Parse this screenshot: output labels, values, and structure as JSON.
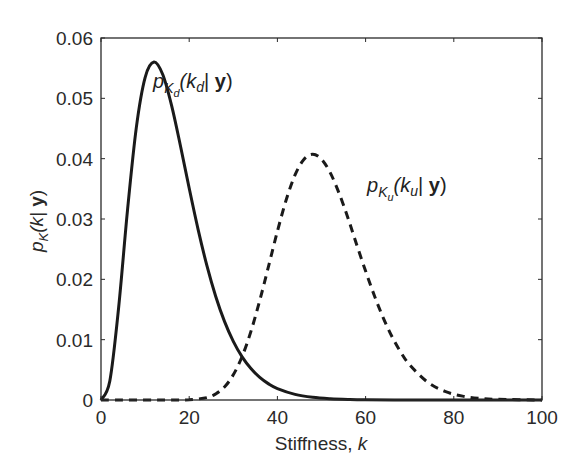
{
  "chart_data": {
    "type": "line",
    "title": "",
    "xlabel": "Stiffness, k",
    "ylabel": "p_K(k| y)",
    "xlim": [
      0,
      100
    ],
    "ylim": [
      0,
      0.06
    ],
    "grid": false,
    "legend": null,
    "x_ticks": [
      0,
      20,
      40,
      60,
      80,
      100
    ],
    "x_tick_labels": [
      "0",
      "20",
      "40",
      "60",
      "80",
      "100"
    ],
    "y_ticks": [
      0,
      0.01,
      0.02,
      0.03,
      0.04,
      0.05,
      0.06
    ],
    "y_tick_labels": [
      "0",
      "0.01",
      "0.02",
      "0.03",
      "0.04",
      "0.05",
      "0.06"
    ],
    "series": [
      {
        "name": "p_Kd(k_d| y)",
        "style": "solid",
        "color": "#1a1a1a",
        "x": [
          0,
          2,
          4,
          6,
          8,
          10,
          12,
          14,
          16,
          18,
          20,
          22,
          24,
          26,
          28,
          30,
          32,
          34,
          36,
          38,
          40,
          44,
          48,
          52,
          56,
          60,
          70,
          80,
          90,
          100
        ],
        "values": [
          0,
          0.00316,
          0.01533,
          0.03138,
          0.04511,
          0.05344,
          0.05601,
          0.05395,
          0.04884,
          0.04219,
          0.03509,
          0.02833,
          0.02231,
          0.0172,
          0.01303,
          0.00972,
          0.00715,
          0.00521,
          0.00375,
          0.00267,
          0.00189,
          0.00093,
          0.00044,
          0.00021,
          9.5e-05,
          4e-05,
          6e-06,
          0,
          0,
          0
        ]
      },
      {
        "name": "p_Ku(k_u| y)",
        "style": "dashed",
        "color": "#1a1a1a",
        "x": [
          0,
          16,
          20,
          24,
          26,
          28,
          30,
          32,
          34,
          36,
          38,
          40,
          42,
          44,
          46,
          48,
          50,
          52,
          54,
          56,
          58,
          60,
          62,
          64,
          66,
          68,
          70,
          74,
          78,
          82,
          86,
          90,
          100
        ],
        "values": [
          0,
          0,
          3.7e-05,
          0.00039,
          0.001,
          0.00215,
          0.00417,
          0.00721,
          0.01137,
          0.01649,
          0.02219,
          0.02796,
          0.03318,
          0.0373,
          0.03987,
          0.04073,
          0.03991,
          0.03764,
          0.03425,
          0.03017,
          0.0257,
          0.02137,
          0.01727,
          0.01362,
          0.01048,
          0.00789,
          0.00582,
          0.00299,
          0.00143,
          0.00064,
          0.00027,
          0.00011,
          0
        ]
      }
    ],
    "annotations": [
      {
        "id": "kd",
        "base": "p",
        "sub": "K",
        "subsub": "d",
        "arg_open": "(k",
        "arg_sub": "d",
        "arg_mid": "| ",
        "arg_bold": "y",
        "arg_close": ")",
        "x": 152,
        "y": 88
      },
      {
        "id": "ku",
        "base": "p",
        "sub": "K",
        "subsub": "u",
        "arg_open": "(k",
        "arg_sub": "u",
        "arg_mid": "| ",
        "arg_bold": "y",
        "arg_close": ")",
        "x": 367,
        "y": 192
      }
    ]
  },
  "axes": {
    "xlabel_main": "Stiffness, ",
    "xlabel_var": "k",
    "ylabel_base": "p",
    "ylabel_sub": "K",
    "ylabel_arg": "(k| ",
    "ylabel_bold": "y",
    "ylabel_close": ")"
  },
  "annotation_text": {
    "kd": {
      "base": "p",
      "sub": "K",
      "subsub": "d",
      "open": "(k",
      "argsub": "d",
      "mid": "| ",
      "bold": "y",
      "close": ")"
    },
    "ku": {
      "base": "p",
      "sub": "K",
      "subsub": "u",
      "open": "(k",
      "argsub": "u",
      "mid": "| ",
      "bold": "y",
      "close": ")"
    }
  }
}
